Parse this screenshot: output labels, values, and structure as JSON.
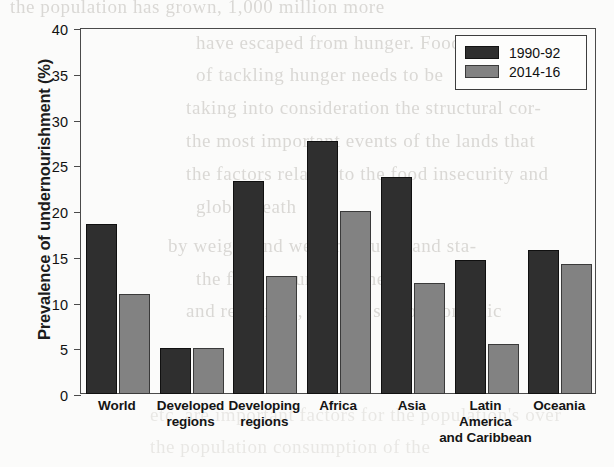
{
  "chart_data": {
    "type": "bar",
    "title": "",
    "subtitle": "",
    "xlabel": "",
    "ylabel": "Prevalence of undernourishment (%)",
    "ylim": [
      0,
      40
    ],
    "yticks": [
      0,
      5,
      10,
      15,
      20,
      25,
      30,
      35,
      40
    ],
    "ytick_labels": [
      "0",
      "5",
      "10",
      "15",
      "20",
      "25",
      "30",
      "35",
      "40"
    ],
    "grid": false,
    "legend_position": "top-right",
    "categories": [
      "World",
      "Developed regions",
      "Developing regions",
      "Africa",
      "Asia",
      "Latin America and Caribbean",
      "Oceania"
    ],
    "category_lines": [
      [
        "World"
      ],
      [
        "Developed",
        "regions"
      ],
      [
        "Developing",
        "regions"
      ],
      [
        "Africa"
      ],
      [
        "Asia"
      ],
      [
        "Latin",
        "America",
        "and Caribbean"
      ],
      [
        "Oceania"
      ]
    ],
    "series": [
      {
        "name": "1990-92",
        "color": "#2f2f2f",
        "values": [
          18.6,
          5.0,
          23.3,
          27.6,
          23.7,
          14.7,
          15.7
        ]
      },
      {
        "name": "2014-16",
        "color": "#828282",
        "values": [
          10.9,
          5.0,
          12.9,
          20.0,
          12.1,
          5.5,
          14.2
        ]
      }
    ]
  },
  "legend": {
    "entries": [
      {
        "label": "1990-92",
        "swatch": "dark-swatch"
      },
      {
        "label": "2014-16",
        "swatch": "gray-swatch"
      }
    ]
  },
  "page_background": {
    "description": "faint scanned bleed-through text from the reverse page",
    "ghost_lines": [
      "the population has grown, 1,000 million more",
      "have escaped from hunger. Food is",
      "of tackling hunger needs to be",
      "taking into consideration the structural cor-",
      "the most important events of the lands that",
      "the factors related to the food insecurity and",
      "global death",
      "by weight and well measured and sta-",
      "the food security. Genetic",
      "and resources, and the socio-economic",
      "etc. are important factors for the population's over",
      "the population consumption of the"
    ]
  }
}
